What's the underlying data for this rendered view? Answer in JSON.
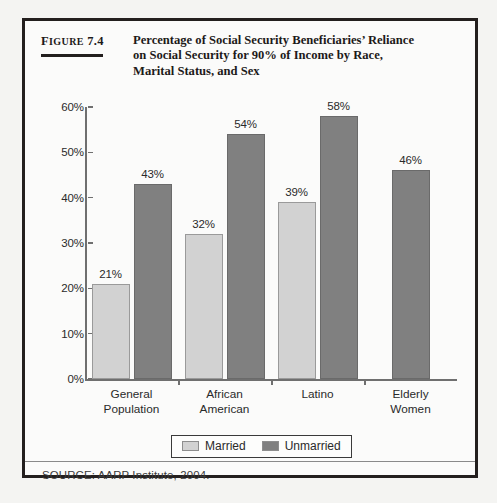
{
  "figure": {
    "label_word": "Figure",
    "label_number": "7.4",
    "title_lines": [
      "Percentage of Social Security Beneficiaries’ Reliance",
      "on Social Security for 90% of Income by Race,",
      "Marital Status, and Sex"
    ],
    "source": "SOURCE: AARP Institute, 2004."
  },
  "colors": {
    "married": "#d2d2d2",
    "unmarried": "#808080",
    "frame": "#231f1e",
    "axis": "#6f6f6f"
  },
  "chart_data": {
    "type": "bar",
    "title": "Percentage of Social Security Beneficiaries’ Reliance on Social Security for 90% of Income by Race, Marital Status, and Sex",
    "xlabel": "",
    "ylabel": "",
    "ylim": [
      0,
      60
    ],
    "ytick_labels": [
      "0%",
      "10%",
      "20%",
      "30%",
      "40%",
      "50%",
      "60%"
    ],
    "ytick_values": [
      0,
      10,
      20,
      30,
      40,
      50,
      60
    ],
    "grid": false,
    "legend_position": "bottom",
    "categories": [
      "General Population",
      "African American",
      "Latino",
      "Elderly Women"
    ],
    "category_lines": [
      [
        "General",
        "Population"
      ],
      [
        "African",
        "American"
      ],
      [
        "Latino",
        ""
      ],
      [
        "Elderly",
        "Women"
      ]
    ],
    "series": [
      {
        "name": "Married",
        "color": "#d2d2d2",
        "values": [
          21,
          32,
          39,
          null
        ],
        "labels": [
          "21%",
          "32%",
          "39%",
          ""
        ]
      },
      {
        "name": "Unmarried",
        "color": "#808080",
        "values": [
          43,
          54,
          58,
          46
        ],
        "labels": [
          "43%",
          "54%",
          "58%",
          "46%"
        ]
      }
    ]
  }
}
